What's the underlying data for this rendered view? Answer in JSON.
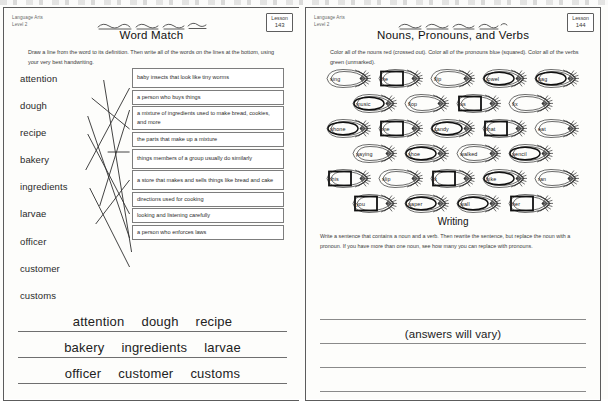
{
  "left_page": {
    "meta_line1": "Language Arts",
    "meta_line2": "Level 2",
    "badge_label": "Lesson",
    "badge_number": "143",
    "title": "Word Match",
    "instructions": "Draw a line from the word to its definition. Then write all of the words on the lines at the bottom, using your very best handwriting.",
    "words": [
      "attention",
      "dough",
      "recipe",
      "bakery",
      "ingredients",
      "larvae",
      "officer",
      "customer",
      "customs"
    ],
    "definitions": [
      "baby insects that look like tiny worms",
      "a person who buys things",
      "a mixture of ingredients used to make bread, cookies, and more",
      "the parts that make up a mixture",
      "things members of a group usually do similarly",
      "a store that makes and sells things like bread and cake",
      "directions used for cooking",
      "looking and listening carefully",
      "a person who enforces laws"
    ],
    "matches": [
      {
        "word": "attention",
        "definition": "looking and listening carefully"
      },
      {
        "word": "dough",
        "definition": "a mixture of ingredients used to make bread, cookies, and more"
      },
      {
        "word": "recipe",
        "definition": "directions used for cooking"
      },
      {
        "word": "bakery",
        "definition": "a store that makes and sells things like bread and cake"
      },
      {
        "word": "ingredients",
        "definition": "the parts that make up a mixture"
      },
      {
        "word": "larvae",
        "definition": "baby insects that look like tiny worms"
      },
      {
        "word": "officer",
        "definition": "a person who enforces laws"
      },
      {
        "word": "customer",
        "definition": "a person who buys things"
      },
      {
        "word": "customs",
        "definition": "things members of a group usually do similarly"
      }
    ],
    "handwriting_rows": [
      [
        "attention",
        "dough",
        "recipe"
      ],
      [
        "bakery",
        "ingredients",
        "larvae"
      ],
      [
        "officer",
        "customer",
        "customs"
      ]
    ]
  },
  "right_page": {
    "meta_line1": "Language Arts",
    "meta_line2": "Level 2",
    "badge_label": "Lesson",
    "badge_number": "144",
    "title": "Nouns, Pronouns, and Verbs",
    "instructions": "Color all of the nouns red (crossed out). Color all of the pronouns blue (squared). Color all of the verbs green (unmarked).",
    "legend": {
      "noun": "red (crossed out)",
      "pronoun": "blue (squared)",
      "verb": "green (unmarked)"
    },
    "word_rows": [
      [
        {
          "word": "sing",
          "type": "verb",
          "mark": "none"
        },
        {
          "word": "he",
          "type": "pronoun",
          "mark": "square"
        },
        {
          "word": "flip",
          "type": "verb",
          "mark": "none"
        },
        {
          "word": "towel",
          "type": "noun",
          "mark": "oval"
        },
        {
          "word": "bag",
          "type": "noun",
          "mark": "oval"
        }
      ],
      [
        {
          "word": "music",
          "type": "noun",
          "mark": "oval"
        },
        {
          "word": "flop",
          "type": "verb",
          "mark": "none"
        },
        {
          "word": "us",
          "type": "pronoun",
          "mark": "square"
        },
        {
          "word": "fix",
          "type": "verb",
          "mark": "none"
        }
      ],
      [
        {
          "word": "phone",
          "type": "noun",
          "mark": "oval"
        },
        {
          "word": "me",
          "type": "pronoun",
          "mark": "square"
        },
        {
          "word": "candy",
          "type": "noun",
          "mark": "oval"
        },
        {
          "word": "that",
          "type": "pronoun",
          "mark": "square"
        },
        {
          "word": "eat",
          "type": "verb",
          "mark": "none"
        }
      ],
      [
        {
          "word": "paying",
          "type": "verb",
          "mark": "none"
        },
        {
          "word": "shoe",
          "type": "noun",
          "mark": "oval"
        },
        {
          "word": "walked",
          "type": "verb",
          "mark": "none"
        },
        {
          "word": "pencil",
          "type": "noun",
          "mark": "oval"
        }
      ],
      [
        {
          "word": "this",
          "type": "pronoun",
          "mark": "square"
        },
        {
          "word": "slip",
          "type": "verb",
          "mark": "none"
        },
        {
          "word": "it",
          "type": "pronoun",
          "mark": "square"
        },
        {
          "word": "bike",
          "type": "noun",
          "mark": "oval"
        },
        {
          "word": "ran",
          "type": "verb",
          "mark": "none"
        }
      ],
      [
        {
          "word": "you",
          "type": "pronoun",
          "mark": "square"
        },
        {
          "word": "paper",
          "type": "noun",
          "mark": "oval"
        },
        {
          "word": "wall",
          "type": "noun",
          "mark": "oval"
        },
        {
          "word": "her",
          "type": "pronoun",
          "mark": "square"
        }
      ]
    ],
    "writing_heading": "Writing",
    "writing_instructions": "Write a sentence that contains a noun and a verb. Then rewrite the sentence, but replace the noun with a pronoun. If you have more than one noun, see how many you can replace with pronouns.",
    "writing_answer": "(answers will vary)",
    "writing_line_count": 4
  },
  "colors": {
    "ink": "#1a1a1a",
    "rule": "#6f6f6f",
    "box_border": "#7d7d7d",
    "page_border": "#5c5c5c",
    "paper": "#fdfdfb"
  }
}
